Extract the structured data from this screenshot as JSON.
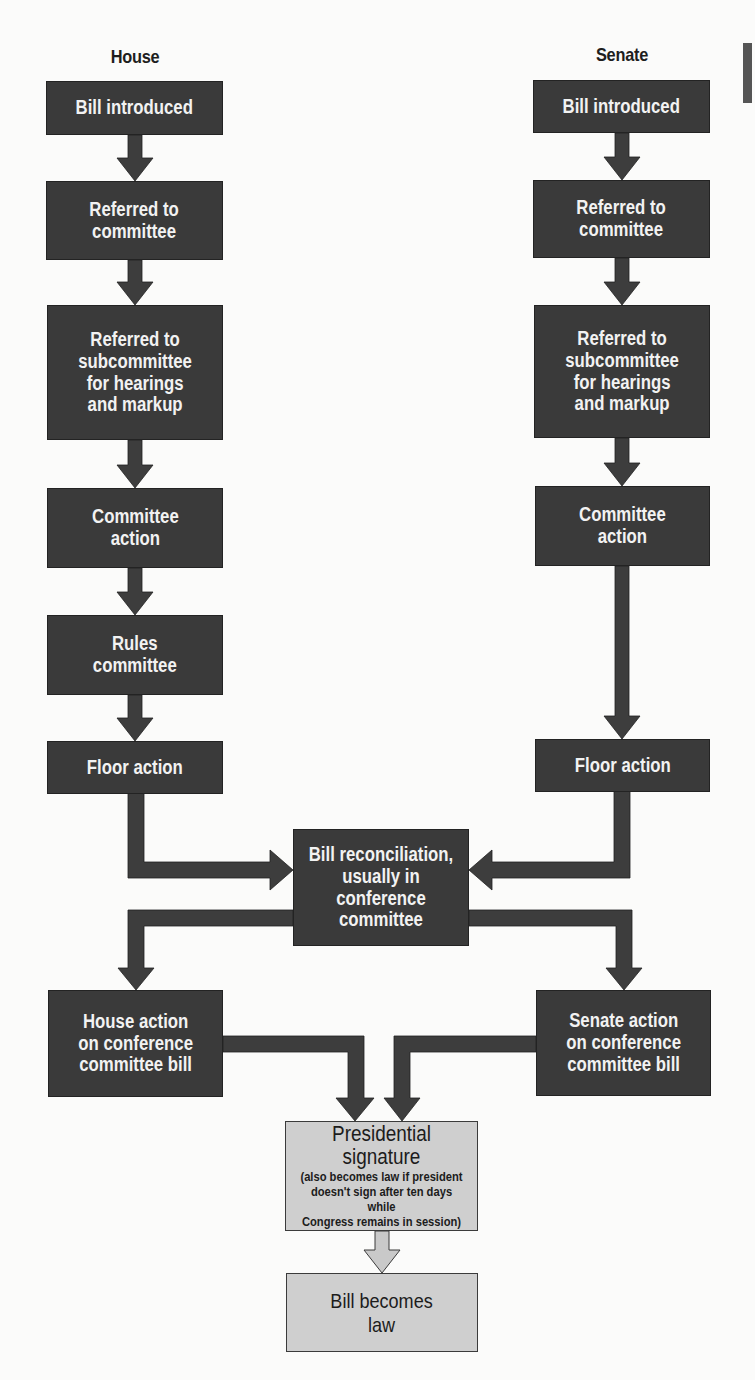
{
  "diagram": {
    "type": "flowchart",
    "colors": {
      "step_box": "#3a3a3a",
      "step_text": "#f2f2f2",
      "final_box": "#cfcfcf",
      "final_text": "#1c1c1c",
      "arrow": "#3d3d3d",
      "final_arrow": "#c9c9c9"
    },
    "house": {
      "title": "House",
      "steps": [
        "Bill introduced",
        "Referred to\ncommittee",
        "Referred to\nsubcommittee\nfor hearings\nand markup",
        "Committee\naction",
        "Rules\ncommittee",
        "Floor action"
      ]
    },
    "senate": {
      "title": "Senate",
      "steps": [
        "Bill introduced",
        "Referred to\ncommittee",
        "Referred to\nsubcommittee\nfor hearings\nand markup",
        "Committee\naction",
        "Floor action"
      ]
    },
    "reconciliation": "Bill reconciliation,\nusually in\nconference\ncommittee",
    "house_final_action": "House action\non conference\ncommittee bill",
    "senate_final_action": "Senate action\non conference\ncommittee bill",
    "presidential": {
      "title": "Presidential\nsignature",
      "note": "(also becomes law if president\ndoesn't sign after ten days while\nCongress remains in session)"
    },
    "result": "Bill becomes\nlaw",
    "edges": [
      [
        "house.0",
        "house.1"
      ],
      [
        "house.1",
        "house.2"
      ],
      [
        "house.2",
        "house.3"
      ],
      [
        "house.3",
        "house.4"
      ],
      [
        "house.4",
        "house.5"
      ],
      [
        "house.5",
        "reconciliation"
      ],
      [
        "senate.0",
        "senate.1"
      ],
      [
        "senate.1",
        "senate.2"
      ],
      [
        "senate.2",
        "senate.3"
      ],
      [
        "senate.3",
        "senate.4"
      ],
      [
        "senate.4",
        "reconciliation"
      ],
      [
        "reconciliation",
        "house_final_action"
      ],
      [
        "reconciliation",
        "senate_final_action"
      ],
      [
        "house_final_action",
        "presidential"
      ],
      [
        "senate_final_action",
        "presidential"
      ],
      [
        "presidential",
        "result"
      ]
    ]
  }
}
